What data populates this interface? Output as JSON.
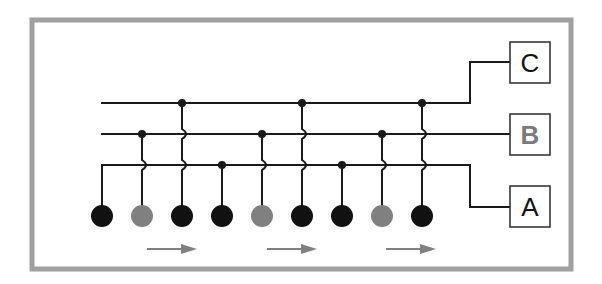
{
  "diagram": {
    "type": "bus-connection-diagram",
    "frame": {
      "x": 32,
      "y": 20,
      "width": 539,
      "height": 249,
      "color": "#a0a0a0",
      "stroke_width": 5
    },
    "colors": {
      "wire": "#1a1a1a",
      "node_black": "#111111",
      "node_gray": "#808080",
      "arrow": "#808080",
      "box_border": "#2a2a2a",
      "label_black": "#111111",
      "label_gray": "#7a7a7a"
    },
    "buses": [
      {
        "id": "C",
        "y": 103,
        "x_start": 101,
        "x_end": 470,
        "route_y": 62
      },
      {
        "id": "B",
        "y": 134,
        "x_start": 101,
        "x_end": 470,
        "route_y": 134
      },
      {
        "id": "A",
        "y": 165,
        "x_start": 101,
        "x_end": 470,
        "route_y": 207
      }
    ],
    "boxes": [
      {
        "label": "C",
        "x": 510,
        "y": 42,
        "width": 40,
        "height": 41,
        "label_color": "black"
      },
      {
        "label": "B",
        "x": 510,
        "y": 114,
        "width": 40,
        "height": 41,
        "label_color": "gray"
      },
      {
        "label": "A",
        "x": 510,
        "y": 186,
        "width": 40,
        "height": 41,
        "label_color": "black"
      }
    ],
    "nodes": [
      {
        "index": 1,
        "x": 102,
        "color": "black",
        "connects_to": "A"
      },
      {
        "index": 2,
        "x": 142,
        "color": "gray",
        "connects_to": "B"
      },
      {
        "index": 3,
        "x": 182,
        "color": "black",
        "connects_to": "C"
      },
      {
        "index": 4,
        "x": 222,
        "color": "black",
        "connects_to": "A"
      },
      {
        "index": 5,
        "x": 262,
        "color": "gray",
        "connects_to": "B"
      },
      {
        "index": 6,
        "x": 302,
        "color": "black",
        "connects_to": "C"
      },
      {
        "index": 7,
        "x": 342,
        "color": "black",
        "connects_to": "A"
      },
      {
        "index": 8,
        "x": 382,
        "color": "gray",
        "connects_to": "B"
      },
      {
        "index": 9,
        "x": 422,
        "color": "black",
        "connects_to": "C"
      }
    ],
    "node_y": 216,
    "node_radius": 11,
    "arrows": [
      {
        "x1": 147,
        "x2": 197,
        "y": 249,
        "direction": "right"
      },
      {
        "x1": 267,
        "x2": 317,
        "y": 249,
        "direction": "right"
      },
      {
        "x1": 386,
        "x2": 436,
        "y": 249,
        "direction": "right"
      }
    ]
  }
}
